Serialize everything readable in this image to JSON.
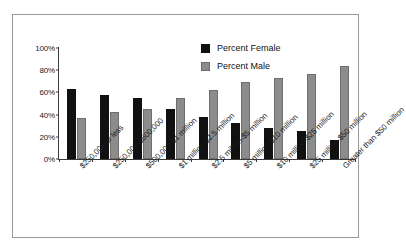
{
  "chart_data": {
    "type": "bar",
    "title": "",
    "subtitle": "",
    "xlabel": "",
    "ylabel": "",
    "ylim": [
      0,
      100
    ],
    "yticks": [
      "0%",
      "20%",
      "40%",
      "60%",
      "80%",
      "100%"
    ],
    "ytick_values": [
      0,
      20,
      40,
      60,
      80,
      100
    ],
    "grid": false,
    "legend_position": "top-right",
    "categories": [
      "$250,000 or less",
      "$250,000-$500,000",
      "$500,000-$1 million",
      "$1 million-$2.5 million",
      "$2.5 million-$5 million",
      "$5 million-$10 million",
      "$10 million-$25 million",
      "$25 million-$50 million",
      "Greater than $50 million"
    ],
    "series": [
      {
        "name": "Percent Female",
        "color": "#111111",
        "values": [
          63,
          58,
          55,
          45,
          38,
          32,
          28,
          25,
          17
        ]
      },
      {
        "name": "Percent Male",
        "color": "#8c8c8c",
        "values": [
          37,
          42,
          45,
          55,
          62,
          69,
          73,
          77,
          84
        ]
      }
    ]
  }
}
